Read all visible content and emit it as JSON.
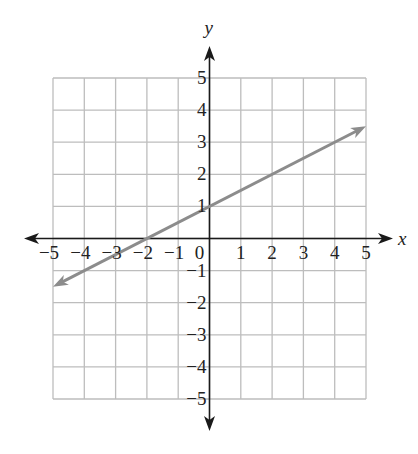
{
  "chart_data": {
    "type": "line",
    "title": "",
    "xlabel": "x",
    "ylabel": "y",
    "xlim": [
      -5,
      5
    ],
    "ylim": [
      -5,
      5
    ],
    "grid": true,
    "x_ticks": [
      -5,
      -4,
      -3,
      -2,
      -1,
      0,
      1,
      2,
      3,
      4,
      5
    ],
    "y_ticks": [
      -5,
      -4,
      -3,
      -2,
      -1,
      1,
      2,
      3,
      4,
      5
    ],
    "x_tick_labels": [
      "−5",
      "−4",
      "−3",
      "−2",
      "−1",
      "0",
      "1",
      "2",
      "3",
      "4",
      "5"
    ],
    "y_tick_labels": [
      "−5",
      "−4",
      "−3",
      "−2",
      "−1",
      "1",
      "2",
      "3",
      "4",
      "5"
    ],
    "series": [
      {
        "name": "line",
        "equation": "y = 0.5x + 1",
        "slope": 0.5,
        "intercept": 1,
        "x": [
          -5,
          -2,
          0,
          2,
          4,
          5
        ],
        "y": [
          -1.5,
          0,
          1,
          2,
          3,
          3.5
        ],
        "arrows_both_ends": true,
        "color": "#8c8c8c"
      }
    ],
    "legend": null
  },
  "style": {
    "grid_color": "#bdbdbd",
    "axis_color": "#1a1a1a",
    "line_color": "#8c8c8c"
  },
  "geometry": {
    "x0": 53,
    "x1": 366,
    "y0": 78,
    "y1": 399,
    "axis_x_left": 24,
    "axis_x_right": 393,
    "axis_y_top": 46,
    "axis_y_bottom": 431
  }
}
